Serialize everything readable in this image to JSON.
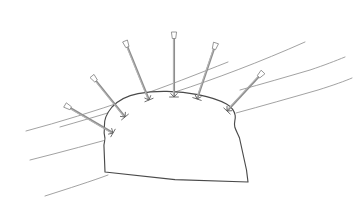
{
  "figure": {
    "background_color": "#ffffff",
    "width": 364,
    "height": 206,
    "style": "hand-drawn line sketch",
    "colors": {
      "strata_line": "#8a8a8a",
      "tunnel_outline": "#4a4a4a",
      "bolt_shaft": "#8d8d8d",
      "bolt_head_fill": "#ffffff",
      "bolt_plate": "#5d5d5d"
    }
  },
  "tunnel": {
    "label": "tunnel-cross-section",
    "description": "Arched horseshoe tunnel profile with irregular hand-drawn walls and a flat, slightly sagging invert",
    "outline_path": "M 105 172 L 104 147 C 103.5 142 106 140 104.6 136 C 103.2 132 105 130 104.4 126 C 104 120 107 113 112 107 C 119 99.5 128 95.5 138 93.6 C 148 91.8 158 91.2 167 91.4 C 177 91.6 188 92.6 198 94.6 C 209 96.8 219 99.8 226.5 104 C 232 107.2 234.5 111 235.2 115.5 C 235.8 119.5 233.5 123 234.8 127 C 236 131 238 134 239.5 138 L 246.5 170 L 248 182 L 175 179.6 L 105 172 Z"
  },
  "strata": {
    "label": "geological-strata-lines",
    "count": 6,
    "description": "Six thin diagonal bedding-plane lines running lower-left to upper-right behind the tunnel",
    "lines": [
      {
        "name": "strata-line-1",
        "path": "M 60 127 C 95 117 135 105 175 92 C 215 79 260 62 305 42"
      },
      {
        "name": "strata-line-2",
        "path": "M 26 131 C 60 122 95 111 130 99 C 165 87 200 73 228 62"
      },
      {
        "name": "strata-line-3",
        "path": "M 240 90 C 262 84 286 77 310 70 C 325 65 335 61 345 57"
      },
      {
        "name": "strata-line-4",
        "path": "M 30 160 C 62 152 95 143 128 134 C 145 129 160 124 172 120"
      },
      {
        "name": "strata-line-5",
        "path": "M 236 113 C 262 106 290 98 318 90 C 334 85 345 81 352 78"
      },
      {
        "name": "strata-line-6",
        "path": "M 45 196 C 70 188 92 181 108 175"
      }
    ]
  },
  "rock_bolts": {
    "label": "rock-bolts",
    "count": 6,
    "description": "Six radial rock bolts anchored in the tunnel crown and haunches, each with an outer head and an inner bearing plate",
    "items": [
      {
        "name": "rock-bolt-1",
        "position": "left-haunch",
        "head_x": 65,
        "head_y": 105,
        "anchor_x": 113,
        "anchor_y": 133,
        "angle_deg": 30
      },
      {
        "name": "rock-bolt-2",
        "position": "upper-left",
        "head_x": 92,
        "head_y": 76,
        "anchor_x": 125,
        "anchor_y": 117,
        "angle_deg": 51
      },
      {
        "name": "rock-bolt-3",
        "position": "left-crown",
        "head_x": 125,
        "head_y": 41,
        "anchor_x": 149,
        "anchor_y": 100,
        "angle_deg": 68
      },
      {
        "name": "rock-bolt-4",
        "position": "crown-center",
        "head_x": 174,
        "head_y": 32,
        "anchor_x": 174,
        "anchor_y": 97,
        "angle_deg": 90
      },
      {
        "name": "rock-bolt-5",
        "position": "right-crown",
        "head_x": 216,
        "head_y": 43,
        "anchor_x": 197,
        "anchor_y": 99,
        "angle_deg": 109
      },
      {
        "name": "rock-bolt-6",
        "position": "right-haunch",
        "head_x": 263,
        "head_y": 72,
        "anchor_x": 227,
        "anchor_y": 111,
        "angle_deg": 133
      }
    ]
  }
}
